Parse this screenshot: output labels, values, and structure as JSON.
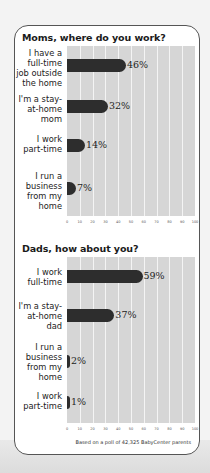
{
  "chart_data": [
    {
      "type": "bar",
      "orientation": "horizontal",
      "title": "Moms, where do you work?",
      "categories": [
        "I have a full-time job outside the home",
        "I'm a stay-at-home mom",
        "I work part-time",
        "I run a business from my home"
      ],
      "values": [
        46,
        32,
        14,
        7
      ],
      "value_labels": [
        "46%",
        "32%",
        "14%",
        "7%"
      ],
      "xlabel": "",
      "ylabel": "",
      "xlim": [
        0,
        100
      ],
      "xticks": [
        0,
        10,
        20,
        30,
        40,
        50,
        60,
        70,
        80,
        90,
        100
      ],
      "grid": true
    },
    {
      "type": "bar",
      "orientation": "horizontal",
      "title": "Dads, how about you?",
      "categories": [
        "I work full-time",
        "I'm a stay-at-home dad",
        "I run a business from my home",
        "I work part-time"
      ],
      "values": [
        59,
        37,
        2,
        1
      ],
      "value_labels": [
        "59%",
        "37%",
        "2%",
        "1%"
      ],
      "xlabel": "",
      "ylabel": "",
      "xlim": [
        0,
        100
      ],
      "xticks": [
        0,
        10,
        20,
        30,
        40,
        50,
        60,
        70,
        80,
        90,
        100
      ],
      "grid": true,
      "footnote": "Based on a poll of 42,325 BabyCenter parents"
    }
  ],
  "moms": {
    "title": "Moms, where do you work?",
    "rows": [
      {
        "label": "I have a\nfull-time\njob outside\nthe home",
        "value": 46,
        "text": "46%"
      },
      {
        "label": "I'm a stay-\nat-home\nmom",
        "value": 32,
        "text": "32%"
      },
      {
        "label": "I work\npart-time",
        "value": 14,
        "text": "14%"
      },
      {
        "label": "I run a\nbusiness\nfrom my\nhome",
        "value": 7,
        "text": "7%"
      }
    ]
  },
  "dads": {
    "title": "Dads, how about you?",
    "rows": [
      {
        "label": "I work\nfull-time",
        "value": 59,
        "text": "59%"
      },
      {
        "label": "I'm a stay-\nat-home\ndad",
        "value": 37,
        "text": "37%"
      },
      {
        "label": "I run a\nbusiness\nfrom my\nhome",
        "value": 2,
        "text": "2%"
      },
      {
        "label": "I work\npart-time",
        "value": 1,
        "text": "1%"
      }
    ]
  },
  "ticks": [
    "0",
    "10",
    "20",
    "30",
    "40",
    "50",
    "60",
    "70",
    "80",
    "90",
    "100"
  ],
  "footnote": "Based on a poll of 42,325 BabyCenter parents",
  "colors": {
    "bar": "#2d2d2d",
    "plot_bg": "#d6d6d6",
    "grid": "#f4f4f4",
    "border": "#555555"
  }
}
